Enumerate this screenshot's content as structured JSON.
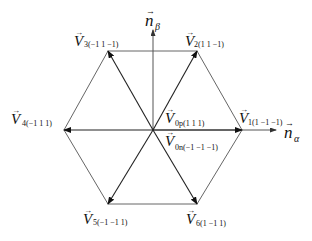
{
  "diagram": {
    "axes": {
      "alpha": {
        "symbol": "n",
        "subscript": "α"
      },
      "beta": {
        "symbol": "n",
        "subscript": "β"
      }
    },
    "vectors": [
      {
        "id": "V1",
        "symbol": "V",
        "subscript": "1(1  −1  −1)"
      },
      {
        "id": "V2",
        "symbol": "V",
        "subscript": "2(1  1  −1)"
      },
      {
        "id": "V3",
        "symbol": "V",
        "subscript": "3(−1  1  −1)"
      },
      {
        "id": "V4",
        "symbol": "V",
        "subscript": "4(−1  1  1)"
      },
      {
        "id": "V5",
        "symbol": "V",
        "subscript": "5(−1  −1  1)"
      },
      {
        "id": "V6",
        "symbol": "V",
        "subscript": "6(1  −1  1)"
      },
      {
        "id": "V0p",
        "symbol": "V",
        "subscript": "0p(1  1  1)"
      },
      {
        "id": "V0n",
        "symbol": "V",
        "subscript": "0n(−1  −1  −1)"
      }
    ],
    "colors": {
      "line": "#333333",
      "hexagon": "#555555",
      "axis": "#444444",
      "text": "#111111"
    }
  }
}
